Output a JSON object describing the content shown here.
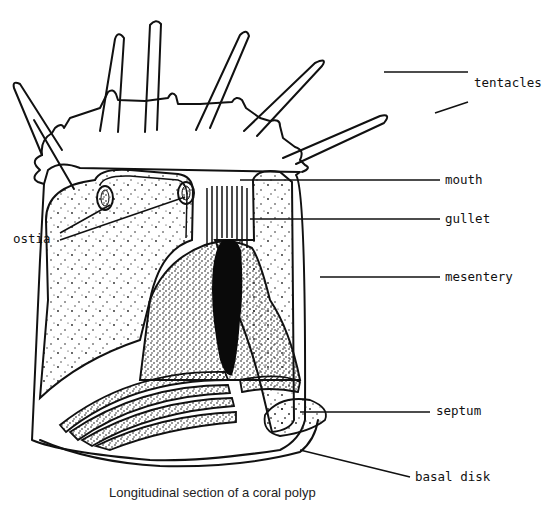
{
  "diagram": {
    "caption": "Longitudinal section of a coral polyp",
    "labels": {
      "tentacles": "tentacles",
      "mouth": "mouth",
      "gullet": "gullet",
      "ostia": "ostia",
      "mesentery": "mesentery",
      "septum": "septum",
      "basal_disk": "basal disk"
    },
    "colors": {
      "ink": "#111111",
      "background": "#ffffff"
    }
  }
}
